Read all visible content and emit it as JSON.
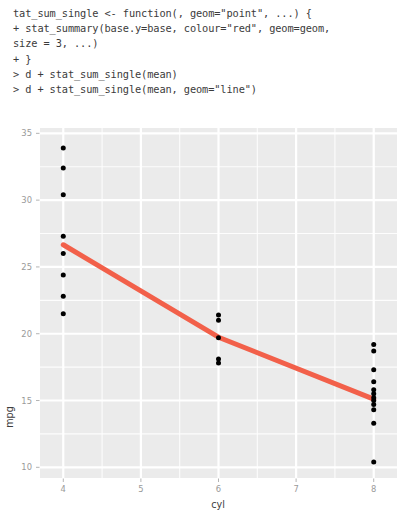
{
  "console": {
    "lines": [
      "tat_sum_single <- function(, geom=\"point\", ...) {",
      "+ stat_summary(base.y=base, colour=\"red\", geom=geom,",
      "size = 3, ...)",
      "+ }",
      "> d + stat_sum_single(mean)",
      "> d + stat_sum_single(mean, geom=\"line\")"
    ]
  },
  "chart_data": {
    "type": "scatter",
    "title": "",
    "xlabel": "cyl",
    "ylabel": "mpg",
    "xlim": [
      3.7,
      8.3
    ],
    "ylim": [
      9.2,
      35.4
    ],
    "xticks": [
      4,
      5,
      6,
      7,
      8
    ],
    "xtick_labels": [
      "4",
      "5",
      "6",
      "7",
      "8"
    ],
    "yticks": [
      10,
      15,
      20,
      25,
      30,
      35
    ],
    "ytick_labels": [
      "10",
      "15",
      "20",
      "25",
      "30",
      "35"
    ],
    "x_minor_ticks": [
      4.5,
      5.5,
      6.5,
      7.5
    ],
    "y_minor_ticks": [
      12.5,
      17.5,
      22.5,
      27.5,
      32.5
    ],
    "grid": true,
    "legend": "none",
    "panel_background": "#EBEBEB",
    "grid_color": "#FFFFFF",
    "point_color": "#000000",
    "series": [
      {
        "name": "mpg by cyl",
        "type": "scatter",
        "marker": "filled-circle",
        "points": [
          {
            "x": 4,
            "y": 33.9
          },
          {
            "x": 4,
            "y": 32.4
          },
          {
            "x": 4,
            "y": 30.4
          },
          {
            "x": 4,
            "y": 27.3
          },
          {
            "x": 4,
            "y": 26.0
          },
          {
            "x": 4,
            "y": 24.4
          },
          {
            "x": 4,
            "y": 22.8
          },
          {
            "x": 4,
            "y": 21.5
          },
          {
            "x": 6,
            "y": 21.4
          },
          {
            "x": 6,
            "y": 21.0
          },
          {
            "x": 6,
            "y": 19.7
          },
          {
            "x": 6,
            "y": 18.1
          },
          {
            "x": 6,
            "y": 17.8
          },
          {
            "x": 8,
            "y": 19.2
          },
          {
            "x": 8,
            "y": 18.7
          },
          {
            "x": 8,
            "y": 17.3
          },
          {
            "x": 8,
            "y": 16.4
          },
          {
            "x": 8,
            "y": 15.8
          },
          {
            "x": 8,
            "y": 15.5
          },
          {
            "x": 8,
            "y": 15.2
          },
          {
            "x": 8,
            "y": 15.0
          },
          {
            "x": 8,
            "y": 14.7
          },
          {
            "x": 8,
            "y": 14.3
          },
          {
            "x": 8,
            "y": 13.3
          },
          {
            "x": 8,
            "y": 10.4
          }
        ]
      },
      {
        "name": "mean line",
        "type": "line",
        "color": "#F2604A",
        "linewidth": 5,
        "points": [
          {
            "x": 4,
            "y": 26.66
          },
          {
            "x": 6,
            "y": 19.74
          },
          {
            "x": 8,
            "y": 15.1
          }
        ]
      }
    ]
  }
}
